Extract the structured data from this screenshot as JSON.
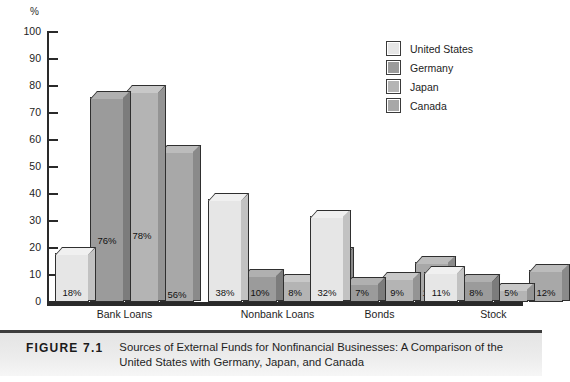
{
  "chart_data": {
    "type": "bar",
    "title": "Sources of External Funds for Nonfinancial Businesses: A Comparison of the United States with Germany, Japan, and Canada",
    "xlabel": "",
    "ylabel": "%",
    "ylim": [
      0,
      100
    ],
    "yticks": [
      0,
      10,
      20,
      30,
      40,
      50,
      60,
      70,
      80,
      90,
      100
    ],
    "grid": false,
    "legend_position": "top-right",
    "categories": [
      "Bank Loans",
      "Nonbank Loans",
      "Bonds",
      "Stock"
    ],
    "series": [
      {
        "name": "United States",
        "color": "#e6e6e6",
        "values": [
          18,
          38,
          32,
          11
        ],
        "labels": [
          "18%",
          "38%",
          "32%",
          "11%"
        ]
      },
      {
        "name": "Germany",
        "color": "#9b9b9b",
        "values": [
          76,
          10,
          7,
          8
        ],
        "labels": [
          "76%",
          "10%",
          "7%",
          "8%"
        ]
      },
      {
        "name": "Japan",
        "color": "#b4b4b4",
        "values": [
          78,
          8,
          9,
          5
        ],
        "labels": [
          "78%",
          "8%",
          "9%",
          "5%"
        ]
      },
      {
        "name": "Canada",
        "color": "#a8a8a8",
        "values": [
          56,
          18,
          15,
          12
        ],
        "labels": [
          "56%",
          "18%",
          "15%",
          "12%"
        ]
      }
    ]
  },
  "axis": {
    "unit_label": "%",
    "tick_labels": [
      "100",
      "90",
      "80",
      "70",
      "60",
      "50",
      "40",
      "30",
      "20",
      "10",
      "0"
    ]
  },
  "legend": {
    "items": [
      {
        "label": "United States"
      },
      {
        "label": "Germany"
      },
      {
        "label": "Japan"
      },
      {
        "label": "Canada"
      }
    ]
  },
  "caption": {
    "number": "FIGURE 7.1",
    "text": "Sources of External Funds for Nonfinancial Businesses: A Comparison of the United States with Germany, Japan, and Canada"
  }
}
